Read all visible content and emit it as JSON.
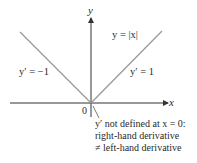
{
  "figure": {
    "axis_x_label": "x",
    "axis_y_label": "y",
    "origin_label": "0",
    "function_label": "y = |x|",
    "left_slope_label": "y′ = −1",
    "right_slope_label": "y′ = 1",
    "annotation": {
      "line1": "y′ not defined at x = 0:",
      "line2": "right-hand derivative",
      "line3": "≠ left-hand derivative"
    },
    "colors": {
      "axis": "#333333",
      "graph": "#9a9a9a",
      "text": "#2a2a2a"
    }
  }
}
